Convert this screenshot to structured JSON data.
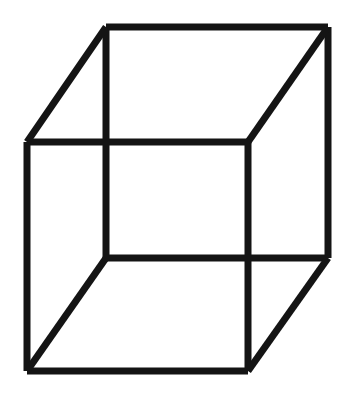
{
  "figure": {
    "name": "Necker cube",
    "type": "line-drawing",
    "canvas": {
      "width": 348,
      "height": 394,
      "background_color": "#ffffff"
    },
    "style": {
      "stroke_color": "#141414",
      "stroke_width": 7,
      "fill": "none"
    },
    "vertices": {
      "back_top_left": [
        106,
        27
      ],
      "back_top_right": [
        328,
        27
      ],
      "back_bottom_right": [
        328,
        258
      ],
      "back_bottom_left": [
        106,
        258
      ],
      "front_top_left": [
        27,
        142
      ],
      "front_top_right": [
        248,
        142
      ],
      "front_bottom_right": [
        248,
        371
      ],
      "front_bottom_left": [
        27,
        371
      ]
    },
    "edges": [
      {
        "name": "back-square-top",
        "points": "106,27 328,27"
      },
      {
        "name": "back-square-right",
        "points": "328,27 328,258"
      },
      {
        "name": "back-square-bottom",
        "points": "328,258 106,258"
      },
      {
        "name": "back-square-left",
        "points": "106,258 106,27"
      },
      {
        "name": "front-square-top",
        "points": "27,142 248,142"
      },
      {
        "name": "front-square-right",
        "points": "248,142 248,371"
      },
      {
        "name": "front-square-bottom",
        "points": "248,371 27,371"
      },
      {
        "name": "front-square-left",
        "points": "27,371 27,142"
      },
      {
        "name": "diagonal-top-left",
        "points": "106,27 27,142"
      },
      {
        "name": "diagonal-top-right",
        "points": "328,27 248,142"
      },
      {
        "name": "diagonal-bottom-right",
        "points": "328,258 248,371"
      },
      {
        "name": "diagonal-bottom-left",
        "points": "106,258 27,371"
      }
    ]
  }
}
